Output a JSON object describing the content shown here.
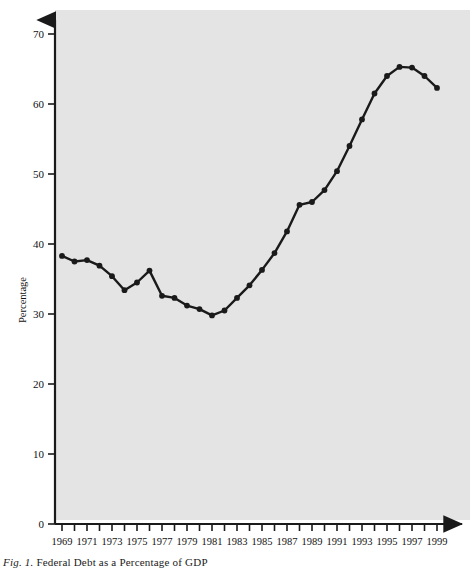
{
  "figure": {
    "caption_lead": "Fig. 1.",
    "caption_rest": "Federal Debt as a Percentage of GDP",
    "background_color": "#ffffff",
    "plot_background_color": "#e4e4e4",
    "line_color": "#1a1a1a",
    "marker_color": "#1a1a1a"
  },
  "chart_data": {
    "type": "line",
    "title": "",
    "xlabel": "",
    "ylabel": "Percentage",
    "xlim": [
      1969,
      1999
    ],
    "ylim": [
      0,
      70
    ],
    "yticks": [
      0,
      10,
      20,
      30,
      40,
      50,
      60,
      70
    ],
    "ytick_labels": [
      "0",
      "10",
      "20",
      "30",
      "40",
      "50",
      "60",
      "70"
    ],
    "xticks": [
      1969,
      1970,
      1971,
      1972,
      1973,
      1974,
      1975,
      1976,
      1977,
      1978,
      1979,
      1980,
      1981,
      1982,
      1983,
      1984,
      1985,
      1986,
      1987,
      1988,
      1989,
      1990,
      1991,
      1992,
      1993,
      1994,
      1995,
      1996,
      1997,
      1998,
      1999
    ],
    "xtick_labels_shown": [
      "1969",
      "1971",
      "1973",
      "1975",
      "1977",
      "1979",
      "1981",
      "1983",
      "1985",
      "1987",
      "1989",
      "1991",
      "1993",
      "1995",
      "1997",
      "1999"
    ],
    "grid": false,
    "legend": null,
    "markers": "filled-circle",
    "x": [
      1969,
      1970,
      1971,
      1972,
      1973,
      1974,
      1975,
      1976,
      1977,
      1978,
      1979,
      1980,
      1981,
      1982,
      1983,
      1984,
      1985,
      1986,
      1987,
      1988,
      1989,
      1990,
      1991,
      1992,
      1993,
      1994,
      1995,
      1996,
      1997,
      1998,
      1999
    ],
    "values": [
      38.3,
      37.5,
      37.7,
      36.9,
      35.4,
      33.4,
      34.5,
      36.2,
      32.6,
      32.3,
      31.2,
      30.7,
      29.8,
      30.5,
      32.3,
      34.1,
      36.3,
      38.7,
      41.8,
      45.6,
      46.0,
      47.7,
      50.4,
      54.0,
      57.8,
      61.5,
      64.0,
      65.3,
      65.2,
      64.0,
      62.3
    ],
    "series": [
      {
        "name": "Federal Debt as a Percentage of GDP",
        "values": [
          38.3,
          37.5,
          37.7,
          36.9,
          35.4,
          33.4,
          34.5,
          36.2,
          32.6,
          32.3,
          31.2,
          30.7,
          29.8,
          30.5,
          32.3,
          34.1,
          36.3,
          38.7,
          41.8,
          45.6,
          46.0,
          47.7,
          50.4,
          54.0,
          57.8,
          61.5,
          64.0,
          65.3,
          65.2,
          64.0,
          62.3
        ]
      }
    ]
  }
}
